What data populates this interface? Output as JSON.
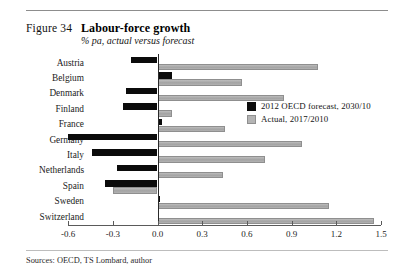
{
  "figure": {
    "label": "Figure 34",
    "title": "Labour-force growth",
    "subtitle": "% pa, actual versus forecast"
  },
  "source": {
    "text": "Sources: OECD, TS Lombard, author"
  },
  "legend": {
    "position": "inside-right",
    "items": [
      {
        "label": "2012 OECD forecast, 2030/10",
        "color": "#0b0b0b",
        "key": "forecast"
      },
      {
        "label": "Actual, 2017/2010",
        "color": "#b4b4b4",
        "key": "actual"
      }
    ]
  },
  "chart_data": {
    "type": "bar",
    "orientation": "horizontal",
    "title": "Labour-force growth",
    "subtitle": "% pa, actual versus forecast",
    "xlabel": "",
    "ylabel": "",
    "xlim": [
      -0.6,
      1.5
    ],
    "xticks": [
      -0.6,
      -0.3,
      0.0,
      0.3,
      0.6,
      0.9,
      1.2,
      1.5
    ],
    "xtick_labels": [
      "-0.6",
      "-0.3",
      "0.0",
      "0.3",
      "0.6",
      "0.9",
      "1.2",
      "1.5"
    ],
    "grid": false,
    "categories": [
      "Austria",
      "Belgium",
      "Denmark",
      "Finland",
      "France",
      "Germany",
      "Italy",
      "Netherlands",
      "Spain",
      "Sweden",
      "Switzerland"
    ],
    "series": [
      {
        "name": "2012 OECD forecast, 2030/10",
        "color": "#0b0b0b",
        "values": [
          -0.18,
          0.1,
          -0.21,
          -0.23,
          0.03,
          -0.6,
          -0.44,
          -0.27,
          -0.35,
          0.02,
          0.01
        ]
      },
      {
        "name": "Actual, 2017/2010",
        "color": "#b4b4b4",
        "values": [
          1.08,
          0.57,
          0.85,
          0.1,
          0.45,
          0.97,
          0.72,
          0.44,
          -0.3,
          1.15,
          1.45
        ]
      }
    ]
  }
}
